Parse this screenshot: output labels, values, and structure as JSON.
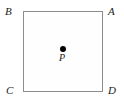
{
  "figure": {
    "shape": "square",
    "background_color": "#ffffff",
    "stroke_color": "#8d8d8d",
    "label_color": "#1a1a1a",
    "point_color": "#000000",
    "vertices": [
      {
        "key": "a",
        "label": "A",
        "position": "top-right"
      },
      {
        "key": "b",
        "label": "B",
        "position": "top-left"
      },
      {
        "key": "c",
        "label": "C",
        "position": "bottom-left"
      },
      {
        "key": "d",
        "label": "D",
        "position": "bottom-right"
      }
    ],
    "interior_point": {
      "label": "P",
      "position": "center"
    }
  }
}
